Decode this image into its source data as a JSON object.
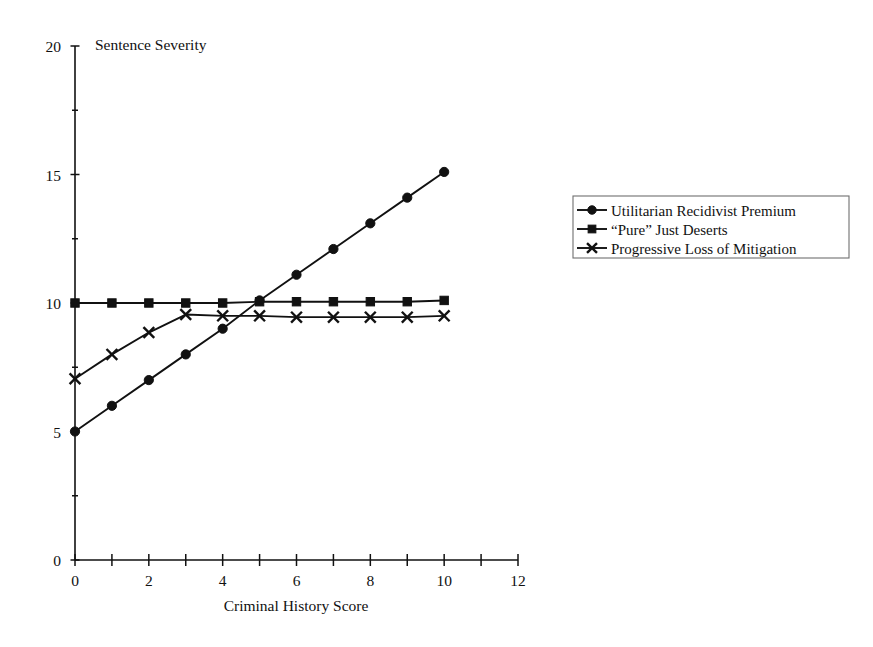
{
  "chart_data": {
    "type": "line",
    "title": "",
    "xlabel": "Criminal History Score",
    "ylabel": "Sentence Severity",
    "xlim": [
      0,
      12
    ],
    "ylim": [
      0,
      20
    ],
    "x_ticks": [
      0,
      1,
      2,
      3,
      4,
      5,
      6,
      7,
      8,
      9,
      10,
      11,
      12
    ],
    "x_tick_labels": [
      "0",
      "",
      "2",
      "",
      "4",
      "",
      "6",
      "",
      "8",
      "",
      "10",
      "",
      "12"
    ],
    "y_ticks": [
      0,
      2.5,
      5,
      7.5,
      10,
      12.5,
      15,
      17.5,
      20
    ],
    "y_tick_labels": [
      "0",
      "",
      "5",
      "",
      "10",
      "",
      "15",
      "",
      "20"
    ],
    "grid": false,
    "legend_position": "right",
    "x": [
      0,
      1,
      2,
      3,
      4,
      5,
      6,
      7,
      8,
      9,
      10
    ],
    "series": [
      {
        "name": "Utilitarian Recidivist Premium",
        "marker": "circle",
        "values": [
          5.0,
          6.0,
          7.0,
          8.0,
          9.0,
          10.1,
          11.1,
          12.1,
          13.1,
          14.1,
          15.1
        ]
      },
      {
        "name": "“Pure” Just Deserts",
        "marker": "square",
        "values": [
          10.0,
          10.0,
          10.0,
          10.0,
          10.0,
          10.05,
          10.05,
          10.05,
          10.05,
          10.05,
          10.1
        ]
      },
      {
        "name": "Progressive Loss of Mitigation",
        "marker": "x",
        "values": [
          7.05,
          8.0,
          8.85,
          9.55,
          9.5,
          9.5,
          9.45,
          9.45,
          9.45,
          9.45,
          9.5
        ]
      }
    ]
  },
  "legend": {
    "entries": [
      {
        "label": "Utilitarian Recidivist Premium",
        "marker": "circle"
      },
      {
        "label": "“Pure” Just Deserts",
        "marker": "square"
      },
      {
        "label": "Progressive Loss of Mitigation",
        "marker": "x"
      }
    ]
  },
  "colors": {
    "ink": "#111111",
    "legend_border": "#6f6f6f",
    "background": "#ffffff"
  }
}
